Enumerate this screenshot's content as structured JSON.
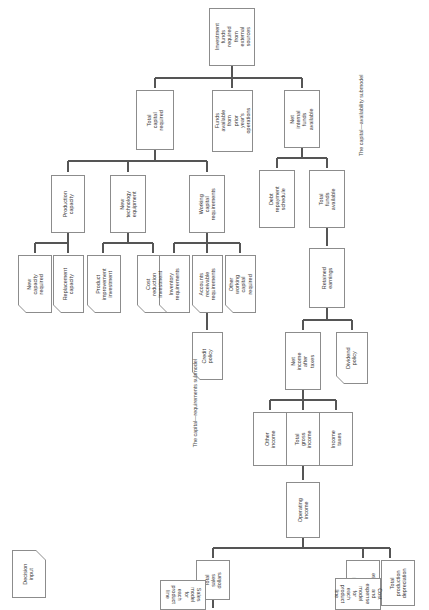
{
  "diagram": {
    "orientation": "text rotated 90 degrees counter-clockwise",
    "line_color": "#555555",
    "box_border_color": "#8c8c8c",
    "background": "#ffffff",
    "captions": [
      {
        "id": "cap-availability",
        "text": "The capital—availability submodel"
      },
      {
        "id": "cap-requirements",
        "text": "The capital—requirements submodel"
      }
    ],
    "legend": {
      "label": "Decision input",
      "shape": "cut-corner pentagon"
    },
    "nodes": [
      {
        "id": "investment-funds",
        "label": "Investment funds required from external sources",
        "shape": "rect"
      },
      {
        "id": "total-capital-required",
        "label": "Total capital required",
        "shape": "rect"
      },
      {
        "id": "funds-available-prior",
        "label": "Funds available from prior year's operations",
        "shape": "rect"
      },
      {
        "id": "net-internal-funds",
        "label": "Net internal funds available",
        "shape": "rect"
      },
      {
        "id": "production-capacity",
        "label": "Production capacity",
        "shape": "rect"
      },
      {
        "id": "new-technology-equipment",
        "label": "New technology equipment",
        "shape": "rect"
      },
      {
        "id": "working-capital-requirements",
        "label": "Working capital requirements",
        "shape": "rect"
      },
      {
        "id": "debt-repayment-schedule",
        "label": "Debt repayment schedule",
        "shape": "rect"
      },
      {
        "id": "total-funds-available",
        "label": "Total funds available",
        "shape": "rect"
      },
      {
        "id": "new-capacity-required",
        "label": "New capacity required",
        "shape": "pentagon"
      },
      {
        "id": "replacement-capacity",
        "label": "Replacement capacity",
        "shape": "pentagon"
      },
      {
        "id": "product-improvement-investment",
        "label": "Product improvement investment",
        "shape": "pentagon"
      },
      {
        "id": "cost-reduction-investment",
        "label": "Cost reduction investment",
        "shape": "pentagon"
      },
      {
        "id": "inventory-requirements",
        "label": "Inventory requirements",
        "shape": "pentagon"
      },
      {
        "id": "accounts-receivable-requirements",
        "label": "Accounts receivable requirements",
        "shape": "pentagon"
      },
      {
        "id": "other-working-capital-required",
        "label": "Other working capital required",
        "shape": "pentagon"
      },
      {
        "id": "retained-earnings",
        "label": "Retained earnings",
        "shape": "rect"
      },
      {
        "id": "credit-policy",
        "label": "Credit policy",
        "shape": "pentagon"
      },
      {
        "id": "net-income-after-taxes",
        "label": "Net income after taxes",
        "shape": "rect"
      },
      {
        "id": "dividend-policy",
        "label": "Dividend policy",
        "shape": "pentagon"
      },
      {
        "id": "other-income",
        "label": "Other income",
        "shape": "rect"
      },
      {
        "id": "total-gross-income",
        "label": "Total gross income",
        "shape": "rect"
      },
      {
        "id": "income-taxes",
        "label": "Income taxes",
        "shape": "rect"
      },
      {
        "id": "operating-income",
        "label": "Operating income",
        "shape": "rect"
      },
      {
        "id": "total-sales-dollars",
        "label": "Total sales dollars",
        "shape": "rect"
      },
      {
        "id": "total-cost-and-expense",
        "label": "Total cost and expense",
        "shape": "rect"
      },
      {
        "id": "total-production-depreciation",
        "label": "Total production depreciation",
        "shape": "rect"
      },
      {
        "id": "sales-model",
        "label": "Sales model for each product line",
        "shape": "rect"
      },
      {
        "id": "cost-expense-model",
        "label": "Cost and expense model for each product line",
        "shape": "rect"
      }
    ]
  }
}
